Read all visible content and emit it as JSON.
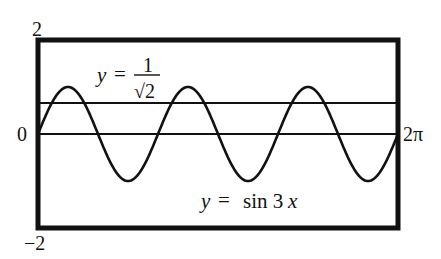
{
  "chart_data": {
    "type": "line",
    "title": "",
    "xlabel": "",
    "ylabel": "",
    "xlim": [
      0,
      6.283185307
    ],
    "ylim": [
      -2,
      2
    ],
    "grid": false,
    "legend": "none",
    "tick_labels": {
      "y_top": "2",
      "y_bottom": "−2",
      "y_zero": "0",
      "x_right": "2π"
    },
    "series": [
      {
        "name": "y = sin 3x",
        "function": "sin(3x)",
        "x": [
          0,
          0.5236,
          1.0472,
          1.5708,
          2.0944,
          2.618,
          3.1416,
          3.6652,
          4.1888,
          4.7124,
          5.236,
          5.7596,
          6.2832
        ],
        "values": [
          0,
          1,
          0,
          -1,
          0,
          1,
          0,
          -1,
          0,
          1,
          0,
          -1,
          0
        ]
      },
      {
        "name": "y = 1/√2",
        "function": "constant",
        "x": [
          0,
          6.2832
        ],
        "values": [
          0.7071,
          0.7071
        ]
      },
      {
        "name": "y = 0 (x-axis)",
        "function": "constant",
        "x": [
          0,
          6.2832
        ],
        "values": [
          0,
          0
        ]
      }
    ],
    "annotations": [
      {
        "text_lhs": "y =",
        "numerator": "1",
        "denominator": "√2",
        "near": "horizontal line, upper left"
      },
      {
        "text": "y =  sin 3x",
        "near": "lower right, below curve"
      }
    ]
  },
  "labels": {
    "y_top": "2",
    "y_bottom": "−2",
    "y_zero": "0",
    "x_right": "2π",
    "hline_y": "y",
    "hline_eq": "=",
    "hline_num": "1",
    "hline_den": "√2",
    "curve_y": "y",
    "curve_eq": "=",
    "curve_fn": "sin 3",
    "curve_x": "x"
  },
  "colors": {
    "ink": "#111111",
    "background": "#ffffff"
  }
}
